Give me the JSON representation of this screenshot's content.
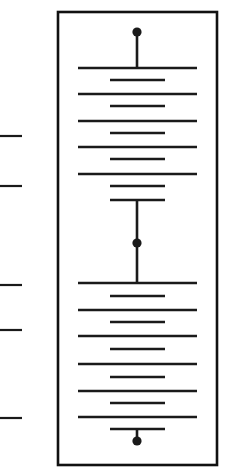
{
  "figure": {
    "domain": "Diagram",
    "title": "",
    "caption": "",
    "background_color": "#ffffff",
    "ink_color": "#1a1a1a",
    "canvas": {
      "width": 235,
      "height": 473
    }
  },
  "frame": {
    "name": "outer-rectangle-frame",
    "x": 58,
    "y": 12,
    "width": 159,
    "height": 453,
    "stroke_width": 2.6,
    "stroke_color": "#111111",
    "fill_color": "#ffffff"
  },
  "geometry": {
    "long_rung_x1": 78,
    "long_rung_x2": 197,
    "short_rung_x1": 110,
    "short_rung_x2": 165,
    "rung_stroke_width": 2.6,
    "stem_x": 137,
    "stem_stroke_width": 2.6,
    "dot_radius": 4.6
  },
  "rungs": [
    {
      "id": "rung-01",
      "y": 68,
      "kind": "long"
    },
    {
      "id": "rung-02",
      "y": 80,
      "kind": "short"
    },
    {
      "id": "rung-03",
      "y": 94,
      "kind": "long"
    },
    {
      "id": "rung-04",
      "y": 106,
      "kind": "short"
    },
    {
      "id": "rung-05",
      "y": 121,
      "kind": "long"
    },
    {
      "id": "rung-06",
      "y": 133,
      "kind": "short"
    },
    {
      "id": "rung-07",
      "y": 147,
      "kind": "long"
    },
    {
      "id": "rung-08",
      "y": 159,
      "kind": "short"
    },
    {
      "id": "rung-09",
      "y": 174,
      "kind": "long"
    },
    {
      "id": "rung-10",
      "y": 186,
      "kind": "short"
    },
    {
      "id": "rung-11",
      "y": 200,
      "kind": "short"
    },
    {
      "id": "rung-12",
      "y": 283,
      "kind": "long"
    },
    {
      "id": "rung-13",
      "y": 296,
      "kind": "short"
    },
    {
      "id": "rung-14",
      "y": 310,
      "kind": "long"
    },
    {
      "id": "rung-15",
      "y": 322,
      "kind": "short"
    },
    {
      "id": "rung-16",
      "y": 336,
      "kind": "long"
    },
    {
      "id": "rung-17",
      "y": 349,
      "kind": "short"
    },
    {
      "id": "rung-18",
      "y": 364,
      "kind": "long"
    },
    {
      "id": "rung-19",
      "y": 377,
      "kind": "short"
    },
    {
      "id": "rung-20",
      "y": 391,
      "kind": "long"
    },
    {
      "id": "rung-21",
      "y": 403,
      "kind": "short"
    },
    {
      "id": "rung-22",
      "y": 417,
      "kind": "long"
    },
    {
      "id": "rung-23",
      "y": 429,
      "kind": "short"
    }
  ],
  "stems": [
    {
      "id": "stem-top",
      "x": 137,
      "y1": 32,
      "y2": 68
    },
    {
      "id": "stem-middle",
      "x": 137,
      "y1": 200,
      "y2": 283
    },
    {
      "id": "stem-bottom",
      "x": 137,
      "y1": 429,
      "y2": 441
    }
  ],
  "nodes": [
    {
      "id": "node-top",
      "label": "top terminal node",
      "x": 137,
      "y": 32,
      "r": 4.6
    },
    {
      "id": "node-middle",
      "label": "middle junction node",
      "x": 137,
      "y": 243,
      "r": 4.6
    },
    {
      "id": "node-bottom",
      "label": "bottom terminal node",
      "x": 137,
      "y": 441,
      "r": 4.6
    }
  ],
  "scale_ticks": {
    "name": "left-margin-scale",
    "x1": 0,
    "x2": 22,
    "stroke_width": 2.2,
    "marks": [
      {
        "id": "tick-1",
        "y": 136,
        "label": ""
      },
      {
        "id": "tick-2",
        "y": 186,
        "label": ""
      },
      {
        "id": "tick-3",
        "y": 285,
        "label": ""
      },
      {
        "id": "tick-4",
        "y": 330,
        "label": ""
      },
      {
        "id": "tick-5",
        "y": 418,
        "label": ""
      }
    ]
  }
}
